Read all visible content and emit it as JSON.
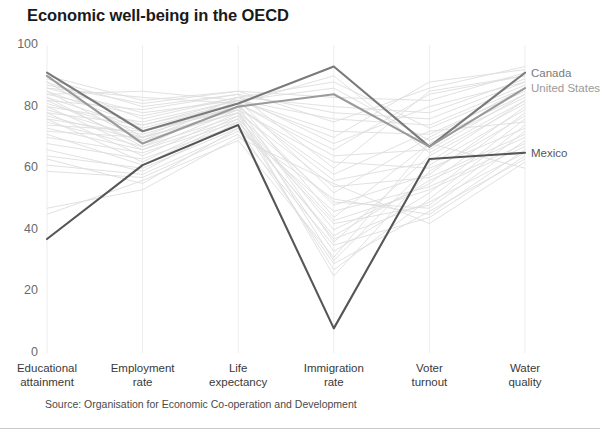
{
  "chart_data": {
    "type": "line",
    "subtype": "parallel-coordinates",
    "title": "Economic well-being in the OECD",
    "source": "Source: Organisation for Economic Co-operation and Development",
    "xlabel": "",
    "ylabel": "",
    "ylim": [
      0,
      100
    ],
    "yticks": [
      0,
      20,
      40,
      60,
      80,
      100
    ],
    "grid": true,
    "legend_position": "right-inline",
    "categories": [
      "Educational attainment",
      "Employment rate",
      "Life expectancy",
      "Immigration rate",
      "Voter turnout",
      "Water quality"
    ],
    "category_lines": [
      [
        "Educational",
        "attainment"
      ],
      [
        "Employment",
        "rate"
      ],
      [
        "Life",
        "expectancy"
      ],
      [
        "Immigration",
        "rate"
      ],
      [
        "Voter",
        "turnout"
      ],
      [
        "Water",
        "quality"
      ]
    ],
    "highlighted_series": [
      {
        "name": "Canada",
        "color": "#7a7a7a",
        "values": [
          91,
          72,
          81,
          93,
          67,
          91
        ]
      },
      {
        "name": "United States",
        "color": "#9a9a9a",
        "values": [
          90,
          68,
          80,
          84,
          67,
          86
        ]
      },
      {
        "name": "Mexico",
        "color": "#565656",
        "values": [
          37,
          61,
          74,
          8,
          63,
          65
        ]
      }
    ],
    "background_series": [
      {
        "name": "country-01",
        "values": [
          88,
          76,
          83,
          80,
          78,
          89
        ]
      },
      {
        "name": "country-02",
        "values": [
          86,
          78,
          82,
          76,
          74,
          87
        ]
      },
      {
        "name": "country-03",
        "values": [
          85,
          74,
          82,
          72,
          71,
          85
        ]
      },
      {
        "name": "country-04",
        "values": [
          84,
          77,
          83,
          68,
          80,
          88
        ]
      },
      {
        "name": "country-05",
        "values": [
          83,
          73,
          81,
          64,
          66,
          84
        ]
      },
      {
        "name": "country-06",
        "values": [
          82,
          79,
          84,
          60,
          85,
          90
        ]
      },
      {
        "name": "country-07",
        "values": [
          81,
          72,
          80,
          56,
          62,
          82
        ]
      },
      {
        "name": "country-08",
        "values": [
          80,
          75,
          82,
          52,
          70,
          86
        ]
      },
      {
        "name": "country-09",
        "values": [
          79,
          70,
          79,
          48,
          58,
          80
        ]
      },
      {
        "name": "country-10",
        "values": [
          78,
          74,
          81,
          44,
          68,
          83
        ]
      },
      {
        "name": "country-11",
        "values": [
          77,
          69,
          78,
          40,
          55,
          78
        ]
      },
      {
        "name": "country-12",
        "values": [
          76,
          71,
          80,
          36,
          64,
          81
        ]
      },
      {
        "name": "country-13",
        "values": [
          75,
          67,
          77,
          33,
          52,
          76
        ]
      },
      {
        "name": "country-14",
        "values": [
          74,
          72,
          79,
          30,
          61,
          79
        ]
      },
      {
        "name": "country-15",
        "values": [
          73,
          66,
          76,
          27,
          50,
          74
        ]
      },
      {
        "name": "country-16",
        "values": [
          72,
          70,
          78,
          25,
          59,
          77
        ]
      },
      {
        "name": "country-17",
        "values": [
          87,
          81,
          85,
          83,
          82,
          91
        ]
      },
      {
        "name": "country-18",
        "values": [
          89,
          80,
          84,
          78,
          76,
          88
        ]
      },
      {
        "name": "country-19",
        "values": [
          70,
          65,
          75,
          42,
          48,
          72
        ]
      },
      {
        "name": "country-20",
        "values": [
          68,
          63,
          74,
          38,
          56,
          70
        ]
      },
      {
        "name": "country-21",
        "values": [
          64,
          60,
          73,
          46,
          54,
          68
        ]
      },
      {
        "name": "country-22",
        "values": [
          61,
          58,
          72,
          50,
          45,
          66
        ]
      },
      {
        "name": "country-23",
        "values": [
          59,
          57,
          71,
          35,
          44,
          64
        ]
      },
      {
        "name": "country-24",
        "values": [
          47,
          53,
          70,
          55,
          42,
          62
        ]
      },
      {
        "name": "country-25",
        "values": [
          45,
          56,
          69,
          31,
          68,
          60
        ]
      },
      {
        "name": "country-26",
        "values": [
          84,
          85,
          82,
          70,
          88,
          92
        ]
      },
      {
        "name": "country-27",
        "values": [
          86,
          83,
          81,
          66,
          84,
          90
        ]
      },
      {
        "name": "country-28",
        "values": [
          82,
          68,
          80,
          58,
          72,
          75
        ]
      },
      {
        "name": "country-29",
        "values": [
          80,
          66,
          79,
          62,
          60,
          73
        ]
      },
      {
        "name": "country-30",
        "values": [
          78,
          64,
          78,
          54,
          57,
          71
        ]
      },
      {
        "name": "country-31",
        "values": [
          88,
          70,
          83,
          88,
          73,
          86
        ]
      },
      {
        "name": "country-32",
        "values": [
          85,
          69,
          82,
          86,
          69,
          84
        ]
      },
      {
        "name": "country-33",
        "values": [
          83,
          67,
          81,
          90,
          65,
          82
        ]
      },
      {
        "name": "country-34",
        "values": [
          76,
          62,
          77,
          49,
          47,
          69
        ]
      },
      {
        "name": "country-35",
        "values": [
          71,
          61,
          76,
          43,
          53,
          67
        ]
      },
      {
        "name": "country-36",
        "values": [
          66,
          59,
          75,
          37,
          49,
          65
        ]
      },
      {
        "name": "country-37",
        "values": [
          63,
          55,
          73,
          29,
          46,
          63
        ]
      },
      {
        "name": "country-38",
        "values": [
          90,
          82,
          85,
          75,
          86,
          93
        ]
      }
    ]
  },
  "axes": {
    "y_tick_labels": [
      "100",
      "80",
      "60",
      "40",
      "20",
      "0"
    ]
  },
  "colors": {
    "background_line": "#dedede",
    "gridline": "#ededed",
    "title_text": "#1a1a1a",
    "tick_text": "#6b6b6b",
    "axis_label_text": "#3a3a3a"
  }
}
